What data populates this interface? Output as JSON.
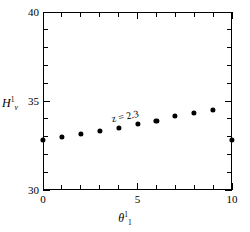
{
  "chart_data": {
    "type": "scatter",
    "title": "",
    "xlabel": "theta_1^1",
    "ylabel": "H_v^1",
    "xlim": [
      0,
      10
    ],
    "ylim": [
      30,
      40
    ],
    "x": [
      0,
      1,
      2,
      3,
      4,
      5,
      6,
      7,
      8,
      9,
      10
    ],
    "values": [
      32.8,
      33.0,
      33.15,
      33.3,
      33.5,
      33.7,
      33.9,
      34.15,
      34.35,
      34.5,
      32.8
    ],
    "series": [
      {
        "name": "z = 2.3",
        "x": [
          0,
          1,
          2,
          3,
          4,
          5,
          6,
          7,
          8,
          9,
          10
        ],
        "values": [
          32.8,
          33.0,
          33.15,
          33.3,
          33.5,
          33.7,
          33.9,
          34.15,
          34.35,
          34.5,
          32.8
        ]
      }
    ],
    "xticks": [
      0,
      1,
      2,
      3,
      4,
      5,
      6,
      7,
      8,
      9,
      10
    ],
    "xticklabels": [
      "0",
      "",
      "",
      "",
      "",
      "5",
      "",
      "",
      "",
      "",
      "10"
    ],
    "yticks": [
      30,
      31,
      32,
      33,
      34,
      35,
      36,
      37,
      38,
      39,
      40
    ],
    "yticklabels": [
      "30",
      "",
      "",
      "",
      "",
      "35",
      "",
      "",
      "",
      "",
      "40"
    ],
    "annotations": [
      {
        "text": "z = 2.3",
        "x": 4.35,
        "y": 34.15,
        "rotation": -11
      }
    ],
    "grid": false,
    "legend": null,
    "marker": "filled-circle",
    "marker_color": "#000000",
    "frame_color": "#000000",
    "background": "#ffffff"
  },
  "axes": {
    "y_title": {
      "symbol": "H",
      "sup": "1",
      "sub": "v"
    },
    "x_title": {
      "symbol": "θ",
      "sup": "1",
      "sub": "1"
    }
  }
}
